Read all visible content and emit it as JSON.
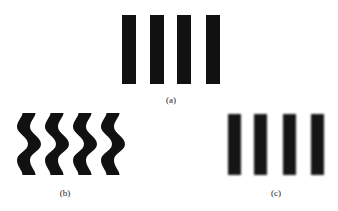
{
  "figure": {
    "panels": [
      {
        "id": "a",
        "label": "(a)",
        "description": "straight vertical bars",
        "bar_count": 4
      },
      {
        "id": "b",
        "label": "(b)",
        "description": "wavy vertical bars",
        "bar_count": 4
      },
      {
        "id": "c",
        "label": "(c)",
        "description": "blurred vertical bars",
        "bar_count": 4
      }
    ],
    "colors": {
      "bar": "#111111",
      "background": "#ffffff"
    }
  }
}
